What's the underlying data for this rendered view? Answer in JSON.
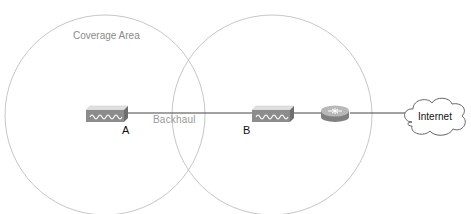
{
  "diagram": {
    "coverage_area_label": "Coverage Area",
    "backhaul_label": "Backhaul",
    "nodes": [
      {
        "id": "A",
        "label": "A",
        "type": "access-point",
        "icon": "wireless-access-point-icon"
      },
      {
        "id": "B",
        "label": "B",
        "type": "access-point",
        "icon": "wireless-access-point-icon"
      },
      {
        "id": "router",
        "label": "",
        "type": "router",
        "icon": "router-icon"
      },
      {
        "id": "internet",
        "label": "Internet",
        "type": "cloud",
        "icon": "cloud-icon"
      }
    ],
    "links": [
      {
        "from": "A",
        "to": "B",
        "label": "Backhaul"
      },
      {
        "from": "B",
        "to": "router",
        "label": ""
      },
      {
        "from": "router",
        "to": "internet",
        "label": ""
      }
    ],
    "coverage_circles": [
      {
        "node": "A",
        "cx": 105,
        "cy": 115,
        "r": 100
      },
      {
        "node": "B",
        "cx": 272,
        "cy": 115,
        "r": 100
      }
    ],
    "colors": {
      "circle_stroke": "#b8b8b8",
      "link": "#444444",
      "ap_body": "#8c8c8c",
      "ap_top": "#d8d8d8",
      "router_body": "#8a8a8a",
      "router_top": "#bdbdbd"
    }
  }
}
